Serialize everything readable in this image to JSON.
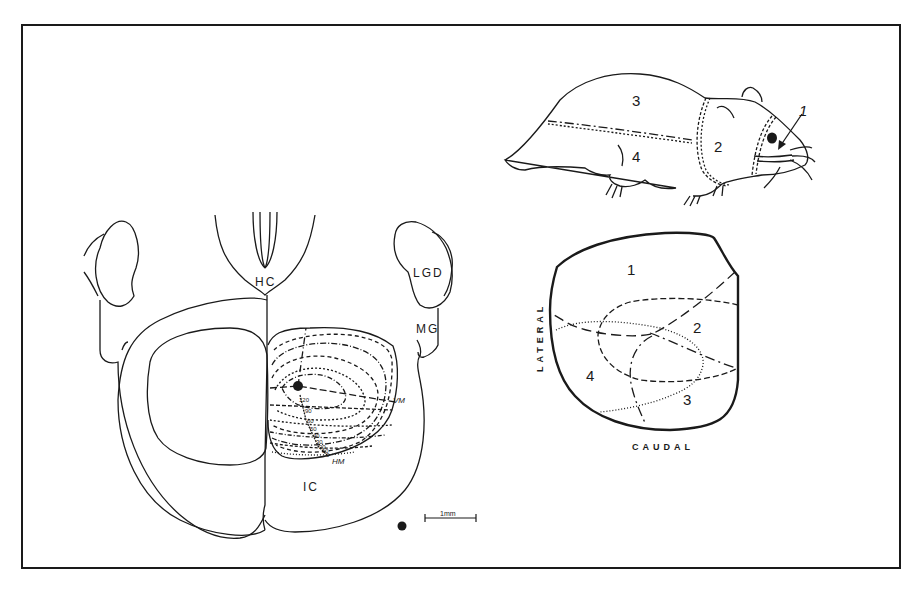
{
  "figure": {
    "frame_color": "#1a1a1a",
    "background": "#ffffff",
    "brain_section": {
      "labels": {
        "hc": "HC",
        "lgd": "LGD",
        "mg": "MG",
        "ic": "IC",
        "vm": "VM",
        "hm": "HM"
      },
      "isoeccentricity_values": [
        "120",
        "90",
        "60",
        "50",
        "40",
        "30",
        "20",
        "10",
        "0"
      ],
      "scale_bar": "1mm"
    },
    "hamster": {
      "regions": [
        "1",
        "2",
        "3",
        "4"
      ]
    },
    "map": {
      "regions": [
        "1",
        "2",
        "3",
        "4"
      ],
      "axis_lateral": "LATERAL",
      "axis_caudal": "CAUDAL"
    }
  }
}
